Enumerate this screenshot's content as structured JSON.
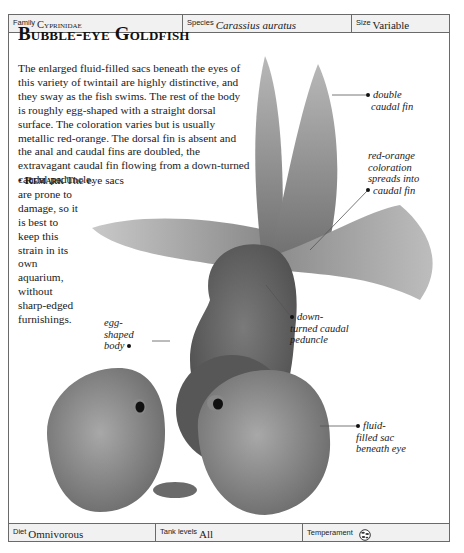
{
  "header": {
    "family": {
      "label": "Family",
      "value": "Cyprinidae"
    },
    "species": {
      "label": "Species",
      "value": "Carassius auratus"
    },
    "size": {
      "label": "Size",
      "value": "Variable"
    }
  },
  "title": "Bubble-eye Goldfish",
  "description": "The enlarged fluid-filled sacs beneath the eyes of this variety of twintail are highly distinctive, and they sway as the fish swims. The rest of the body is roughly egg-shaped with a straight dorsal surface. The coloration varies but is usually metallic red-orange. The dorsal fin is absent and the anal and caudal fins are doubled, the extravagant caudal fin flowing from a down-turned caudal peduncle.",
  "remark": {
    "bullet": "•",
    "heading": "Remark",
    "lead": "The eye sacs",
    "text": "are prone to damage, so it is best to keep this strain in its own aquarium, without sharp-edged furnishings."
  },
  "callouts": {
    "double_caudal": [
      "double",
      "caudal fin"
    ],
    "coloration": [
      "red-orange",
      "coloration",
      "spreads into",
      "caudal fin"
    ],
    "peduncle": [
      "down-",
      "turned caudal",
      "peduncle"
    ],
    "egg_body": [
      "egg-",
      "shaped",
      "body"
    ],
    "sac": [
      "fluid-",
      "filled sac",
      "beneath eye"
    ]
  },
  "footer": {
    "diet": {
      "label": "Diet",
      "value": "Omnivorous"
    },
    "tank_levels": {
      "label": "Tank levels",
      "value": "All"
    },
    "temperament": {
      "label": "Temperament",
      "icon": "peaceful-community-icon"
    }
  },
  "colors": {
    "border": "#6a6a6a",
    "bar_bg": "#f1f1f1",
    "text": "#1a1a1a"
  }
}
